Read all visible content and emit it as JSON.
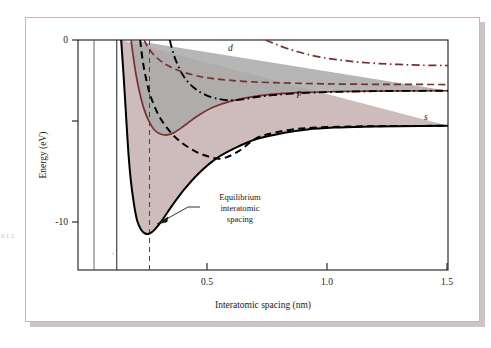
{
  "figure": {
    "name": "band-energy-vs-interatomic-spacing",
    "page_margin_text": "0\n1\n2"
  },
  "axes": {
    "x": {
      "title": "Interatomic spacing (nm)",
      "ticks": [
        "0.5",
        "1.0",
        "1.5"
      ],
      "tick_values": [
        0.5,
        1.0,
        1.5
      ],
      "range": [
        0.0,
        1.5
      ]
    },
    "y": {
      "title": "Energy (eV)",
      "ticks": [
        "0",
        "-10"
      ],
      "tick_values": [
        0,
        -10
      ],
      "range": [
        -12.6,
        0
      ]
    }
  },
  "annotation": {
    "line1": "Equilibrium",
    "line2": "interatomic",
    "line3": "spacing",
    "target_x": 0.29
  },
  "curve_labels": {
    "d": "d",
    "p": "p",
    "s": "s"
  },
  "colors": {
    "dark_red": "#7a2f2f",
    "black": "#000000",
    "s_band_fill": "#c6b0b0",
    "p_band_fill": "#a9a9a9",
    "frame": "#cbb4b4",
    "shadow": "#cfc3c3",
    "axis": "#1a1a1a"
  },
  "chart_data": {
    "type": "line",
    "title": "",
    "xlabel": "Interatomic spacing (nm)",
    "ylabel": "Energy (eV)",
    "xlim": [
      0.0,
      1.5
    ],
    "ylim": [
      -12.6,
      0
    ],
    "grid": false,
    "legend": "inline-curve-labels",
    "xticks": [
      0.5,
      1.0,
      1.5
    ],
    "yticks": [
      0,
      -10
    ],
    "annotations": [
      {
        "text": "Equilibrium interatomic spacing",
        "points_to_x": 0.29,
        "points_to_y": -9.9
      },
      {
        "text": "d",
        "x": 0.52,
        "y": -1.2
      },
      {
        "text": "p",
        "x": 1.04,
        "y": -3.0
      },
      {
        "text": "s",
        "x": 1.42,
        "y": -4.4
      }
    ],
    "reference_lines": [
      {
        "name": "equilibrium-spacing",
        "x": 0.29,
        "style": "dashed",
        "color": "#444444"
      },
      {
        "name": "inner-vertical-1",
        "x": 0.065,
        "style": "solid",
        "color": "#555555"
      },
      {
        "name": "inner-vertical-2",
        "x": 0.157,
        "style": "solid",
        "color": "#333333"
      }
    ],
    "series": [
      {
        "name": "s-band-lower-edge",
        "style": "solid",
        "color": "#000000",
        "points": [
          [
            0.175,
            0.0
          ],
          [
            0.186,
            -2.2
          ],
          [
            0.196,
            -4.4
          ],
          [
            0.205,
            -6.3
          ],
          [
            0.215,
            -7.8
          ],
          [
            0.227,
            -9.0
          ],
          [
            0.24,
            -9.9
          ],
          [
            0.256,
            -10.4
          ],
          [
            0.272,
            -10.6
          ],
          [
            0.29,
            -10.6
          ],
          [
            0.31,
            -10.4
          ],
          [
            0.34,
            -9.9
          ],
          [
            0.38,
            -9.1
          ],
          [
            0.43,
            -8.2
          ],
          [
            0.49,
            -7.3
          ],
          [
            0.56,
            -6.5
          ],
          [
            0.64,
            -5.9
          ],
          [
            0.73,
            -5.4
          ],
          [
            0.83,
            -5.1
          ],
          [
            0.93,
            -4.9
          ],
          [
            1.04,
            -4.8
          ],
          [
            1.16,
            -4.75
          ],
          [
            1.3,
            -4.72
          ],
          [
            1.5,
            -4.7
          ]
        ]
      },
      {
        "name": "s-band-upper-edge",
        "style": "dashed",
        "color": "#000000",
        "points": [
          [
            0.252,
            0.0
          ],
          [
            0.262,
            -1.1
          ],
          [
            0.274,
            -2.0
          ],
          [
            0.288,
            -2.8
          ],
          [
            0.306,
            -3.5
          ],
          [
            0.33,
            -4.2
          ],
          [
            0.36,
            -4.8
          ],
          [
            0.4,
            -5.4
          ],
          [
            0.45,
            -5.9
          ],
          [
            0.51,
            -6.3
          ],
          [
            0.58,
            -6.5
          ],
          [
            0.65,
            -6.1
          ],
          [
            0.72,
            -5.4
          ],
          [
            0.79,
            -5.1
          ],
          [
            0.87,
            -4.9
          ],
          [
            0.96,
            -4.8
          ],
          [
            1.07,
            -4.75
          ],
          [
            1.2,
            -4.72
          ],
          [
            1.5,
            -4.7
          ]
        ]
      },
      {
        "name": "p-band-lower-edge",
        "style": "solid",
        "color": "#7a2f2f",
        "points": [
          [
            0.215,
            0.0
          ],
          [
            0.226,
            -1.1
          ],
          [
            0.238,
            -2.1
          ],
          [
            0.252,
            -3.0
          ],
          [
            0.268,
            -3.8
          ],
          [
            0.286,
            -4.4
          ],
          [
            0.308,
            -4.9
          ],
          [
            0.334,
            -5.15
          ],
          [
            0.362,
            -5.2
          ],
          [
            0.392,
            -5.05
          ],
          [
            0.43,
            -4.7
          ],
          [
            0.48,
            -4.2
          ],
          [
            0.545,
            -3.7
          ],
          [
            0.62,
            -3.35
          ],
          [
            0.71,
            -3.1
          ],
          [
            0.81,
            -2.95
          ],
          [
            0.92,
            -2.87
          ],
          [
            1.04,
            -2.83
          ],
          [
            1.18,
            -2.8
          ],
          [
            1.5,
            -2.78
          ]
        ]
      },
      {
        "name": "p-band-upper-edge",
        "style": "dash-dot",
        "color": "#000000",
        "points": [
          [
            0.372,
            0.0
          ],
          [
            0.386,
            -0.7
          ],
          [
            0.402,
            -1.3
          ],
          [
            0.422,
            -1.85
          ],
          [
            0.446,
            -2.3
          ],
          [
            0.478,
            -2.7
          ],
          [
            0.516,
            -3.0
          ],
          [
            0.56,
            -3.2
          ],
          [
            0.61,
            -3.3
          ],
          [
            0.666,
            -3.25
          ],
          [
            0.724,
            -3.12
          ],
          [
            0.79,
            -3.02
          ],
          [
            0.866,
            -2.94
          ],
          [
            0.95,
            -2.88
          ],
          [
            1.05,
            -2.84
          ],
          [
            1.17,
            -2.81
          ],
          [
            1.3,
            -2.79
          ],
          [
            1.5,
            -2.78
          ]
        ]
      },
      {
        "name": "d-band-lower-edge",
        "style": "dashed",
        "color": "#7a2f2f",
        "points": [
          [
            0.268,
            0.0
          ],
          [
            0.286,
            -0.45
          ],
          [
            0.31,
            -0.85
          ],
          [
            0.34,
            -1.2
          ],
          [
            0.378,
            -1.5
          ],
          [
            0.424,
            -1.75
          ],
          [
            0.478,
            -1.95
          ],
          [
            0.54,
            -2.1
          ],
          [
            0.61,
            -2.2
          ],
          [
            0.69,
            -2.28
          ],
          [
            0.78,
            -2.33
          ],
          [
            0.88,
            -2.37
          ],
          [
            0.99,
            -2.4
          ],
          [
            1.11,
            -2.42
          ],
          [
            1.24,
            -2.43
          ],
          [
            1.5,
            -2.44
          ]
        ]
      },
      {
        "name": "d-band-upper-edge",
        "style": "dash-dot",
        "color": "#7a2f2f",
        "points": [
          [
            0.76,
            0.0
          ],
          [
            0.8,
            -0.22
          ],
          [
            0.845,
            -0.45
          ],
          [
            0.895,
            -0.66
          ],
          [
            0.95,
            -0.85
          ],
          [
            1.01,
            -1.0
          ],
          [
            1.075,
            -1.12
          ],
          [
            1.145,
            -1.22
          ],
          [
            1.22,
            -1.29
          ],
          [
            1.3,
            -1.34
          ],
          [
            1.39,
            -1.38
          ],
          [
            1.5,
            -1.4
          ]
        ]
      }
    ],
    "bands": [
      {
        "name": "s-band-shaded-region",
        "fill": "#c6b0b0",
        "between": [
          "s-band-lower-edge",
          "s-band-upper-edge"
        ]
      },
      {
        "name": "p-band-shaded-region",
        "fill": "#a9a9a9",
        "between": [
          "p-band-lower-edge",
          "p-band-upper-edge"
        ]
      }
    ]
  }
}
